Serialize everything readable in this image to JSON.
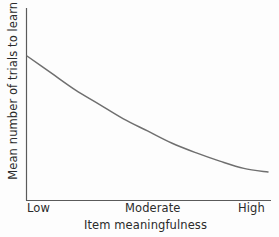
{
  "chart_data": {
    "type": "line",
    "title": "",
    "subtitle": "",
    "xlabel": "Item meaningfulness",
    "ylabel": "Mean number of trials to learn",
    "x_tick_labels": [
      "Low",
      "Moderate",
      "High"
    ],
    "y_tick_labels": [],
    "grid": false,
    "legend": null,
    "legend_position": "none",
    "axis_style": "open-left-bottom",
    "line_color": "#6f6f6f",
    "axis_color": "#5a5a5a",
    "text_color": "#2b2b2b",
    "background_color": "#fdfdfd",
    "xlim": [
      0,
      1
    ],
    "ylim": [
      0,
      1
    ],
    "annotation": "Negatively accelerated decreasing curve: number of trials to learn declines steeply as item meaningfulness increases from low to moderate, then levels off approaching an asymptote at high meaningfulness.",
    "series": [
      {
        "name": "Mean trials to learn",
        "x": [
          0.0,
          0.1,
          0.2,
          0.3,
          0.4,
          0.5,
          0.6,
          0.7,
          0.8,
          0.9,
          1.0
        ],
        "y": [
          1.0,
          0.86,
          0.72,
          0.6,
          0.48,
          0.38,
          0.28,
          0.2,
          0.13,
          0.07,
          0.04
        ]
      }
    ],
    "pixel_path": {
      "start": [
        27,
        56
      ],
      "end": [
        268,
        172
      ],
      "control_points": [
        [
          95,
          92
        ],
        [
          170,
          160
        ],
        [
          215,
          168
        ]
      ]
    }
  },
  "axis": {
    "x_title": "Item meaningfulness",
    "y_title": "Mean number of trials to learn",
    "ticks": {
      "low": "Low",
      "moderate": "Moderate",
      "high": "High"
    }
  }
}
